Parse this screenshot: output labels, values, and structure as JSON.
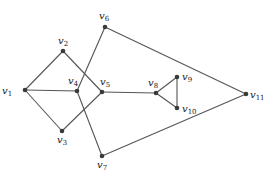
{
  "graph": {
    "nodes": [
      {
        "id": "v1",
        "label": "v",
        "sub": "1",
        "x": 25,
        "y": 90,
        "lx": 2,
        "ly": 94
      },
      {
        "id": "v2",
        "label": "v",
        "sub": "2",
        "x": 63,
        "y": 51,
        "lx": 58,
        "ly": 44
      },
      {
        "id": "v3",
        "label": "v",
        "sub": "3",
        "x": 62,
        "y": 131,
        "lx": 57,
        "ly": 143
      },
      {
        "id": "v4",
        "label": "v",
        "sub": "4",
        "x": 77,
        "y": 91,
        "lx": 68,
        "ly": 84
      },
      {
        "id": "v5",
        "label": "v",
        "sub": "5",
        "x": 102,
        "y": 92,
        "lx": 100,
        "ly": 85
      },
      {
        "id": "v6",
        "label": "v",
        "sub": "6",
        "x": 105,
        "y": 27,
        "lx": 99,
        "ly": 19
      },
      {
        "id": "v7",
        "label": "v",
        "sub": "7",
        "x": 102,
        "y": 156,
        "lx": 97,
        "ly": 168
      },
      {
        "id": "v8",
        "label": "v",
        "sub": "8",
        "x": 156,
        "y": 93,
        "lx": 148,
        "ly": 86
      },
      {
        "id": "v9",
        "label": "v",
        "sub": "9",
        "x": 177,
        "y": 77,
        "lx": 182,
        "ly": 80
      },
      {
        "id": "v10",
        "label": "v",
        "sub": "10",
        "x": 177,
        "y": 108,
        "lx": 182,
        "ly": 112
      },
      {
        "id": "v11",
        "label": "v",
        "sub": "11",
        "x": 246,
        "y": 94,
        "lx": 250,
        "ly": 98
      }
    ],
    "edges": [
      [
        "v1",
        "v2"
      ],
      [
        "v1",
        "v4"
      ],
      [
        "v1",
        "v3"
      ],
      [
        "v2",
        "v5"
      ],
      [
        "v3",
        "v5"
      ],
      [
        "v6",
        "v4"
      ],
      [
        "v4",
        "v7"
      ],
      [
        "v5",
        "v8"
      ],
      [
        "v8",
        "v9"
      ],
      [
        "v8",
        "v10"
      ],
      [
        "v9",
        "v10"
      ],
      [
        "v6",
        "v11"
      ],
      [
        "v7",
        "v11"
      ]
    ]
  }
}
